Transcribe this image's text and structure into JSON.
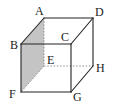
{
  "diagram": {
    "type": "cube",
    "shaded_face": [
      "A",
      "B",
      "F",
      "E"
    ],
    "colors": {
      "edge": "#222222",
      "hidden_edge": "#888888",
      "shade": "#bdbdbd",
      "background": "#ffffff"
    },
    "vertices": {
      "A": {
        "label": "A",
        "x": 44,
        "y": 18
      },
      "B": {
        "label": "B",
        "x": 21,
        "y": 44
      },
      "C": {
        "label": "C",
        "x": 71,
        "y": 44
      },
      "D": {
        "label": "D",
        "x": 93,
        "y": 18
      },
      "E": {
        "label": "E",
        "x": 44,
        "y": 66
      },
      "F": {
        "label": "F",
        "x": 21,
        "y": 92
      },
      "G": {
        "label": "G",
        "x": 71,
        "y": 92
      },
      "H": {
        "label": "H",
        "x": 93,
        "y": 66
      }
    },
    "visible_edges": [
      [
        "A",
        "D"
      ],
      [
        "A",
        "B"
      ],
      [
        "B",
        "C"
      ],
      [
        "C",
        "D"
      ],
      [
        "B",
        "F"
      ],
      [
        "F",
        "G"
      ],
      [
        "C",
        "G"
      ],
      [
        "D",
        "H"
      ],
      [
        "G",
        "H"
      ]
    ],
    "hidden_edges": [
      [
        "A",
        "E"
      ],
      [
        "E",
        "F"
      ],
      [
        "E",
        "H"
      ]
    ]
  }
}
